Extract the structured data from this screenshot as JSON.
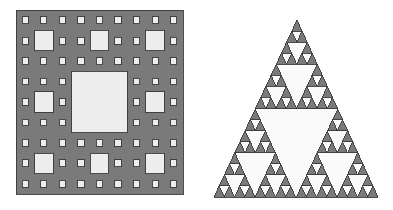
{
  "page": {
    "background_color": "#ffffff",
    "width": 393,
    "height": 210
  },
  "palette": {
    "fill_gray": "#7a7a7a",
    "hole_light": "#ededed",
    "hole_white": "#fafafa",
    "outline_dark": "#3a3a3a",
    "background": "#ffffff"
  },
  "figures": [
    {
      "id": "sierpinski-carpet",
      "name": "Sierpinski carpet",
      "label": "",
      "shape": "square",
      "depth": 3,
      "subdivision": 3,
      "grid_cells": 27,
      "bounds": {
        "x": 16,
        "y": 10,
        "width": 167,
        "height": 184
      },
      "fill_color": "#7a7a7a",
      "hole_color": "#ededed",
      "outline_color": "#3a3a3a",
      "outline_width": 0.9,
      "removed_rule": "center cell of every 3x3 block"
    },
    {
      "id": "sierpinski-triangle",
      "name": "Sierpinski triangle",
      "label": "",
      "shape": "triangle",
      "depth": 4,
      "subdivision": 2,
      "apex": {
        "x": 297,
        "y": 20
      },
      "base_left": {
        "x": 214,
        "y": 197
      },
      "base_right": {
        "x": 378,
        "y": 197
      },
      "bounds": {
        "x": 214,
        "y": 20,
        "width": 164,
        "height": 177
      },
      "fill_color": "#7a7a7a",
      "hole_color": "#fafafa",
      "outline_color": "#3a3a3a",
      "outline_width": 0.9,
      "removed_rule": "central inverted triangle at every level"
    }
  ],
  "chart_data": {
    "type": "diagram",
    "title": "",
    "items": [
      {
        "name": "Sierpinski carpet",
        "iterations": 3,
        "base_squares_per_step": 8,
        "removed_per_step": 1,
        "total_filled_cells": 512,
        "grid": "27 x 27",
        "hausdorff_dimension": 1.8928
      },
      {
        "name": "Sierpinski triangle",
        "iterations": 4,
        "base_triangles_per_step": 3,
        "removed_per_step": 1,
        "total_filled_triangles": 81,
        "hausdorff_dimension": 1.585
      }
    ]
  }
}
